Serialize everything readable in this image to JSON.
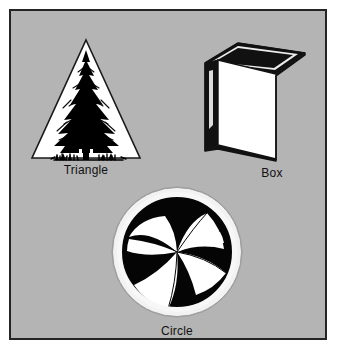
{
  "panel": {
    "background_color": "#b4b4b4",
    "border_color": "#242424",
    "page_background": "#ffffff"
  },
  "figures": [
    {
      "id": "triangle",
      "caption": "Triangle",
      "icon_name": "triangle-pine-tree-icon",
      "description": "Outlined triangle with white fill containing a black pine tree and a ground line with grass tufts",
      "fill_color": "#ffffff",
      "outline_color": "#1a1a1a",
      "art_color": "#000000"
    },
    {
      "id": "box",
      "caption": "Box",
      "icon_name": "box-3d-icon",
      "description": "Three dimensional flat box shown in perspective with white front face and dark left side and top edge",
      "front_color": "#ffffff",
      "side_color": "#111111",
      "outline_color": "#111111"
    },
    {
      "id": "circle",
      "caption": "Circle",
      "icon_name": "circle-pinwheel-icon",
      "description": "Circle with white outer ring containing a black disc with white curved pinwheel blades",
      "ring_color": "#f2f2f2",
      "disc_color": "#050505",
      "blade_color": "#ffffff",
      "blade_count": 6
    }
  ],
  "labels": {
    "triangle": "Triangle",
    "box": "Box",
    "circle": "Circle"
  }
}
